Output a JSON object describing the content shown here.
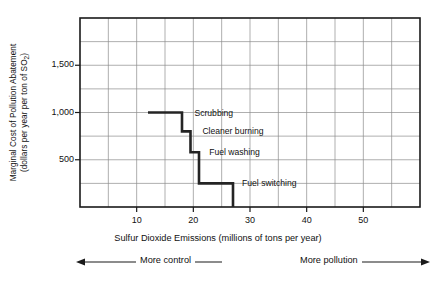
{
  "chart_data": {
    "type": "line",
    "title": "",
    "subtitle": "",
    "xlabel": "Sulfur Dioxide Emissions (millions of tons per year)",
    "ylabel_line1": "Marginal Cost of Pollution Abatement",
    "ylabel_line2_pre": "(dollars per year per ton of SO",
    "ylabel_line2_sub": "2",
    "ylabel_line2_post": ")",
    "xlim": [
      0,
      60
    ],
    "ylim": [
      0,
      2000
    ],
    "xticks": [
      10,
      20,
      30,
      40,
      50
    ],
    "xtick_labels": [
      "10",
      "20",
      "30",
      "40",
      "50"
    ],
    "yticks": [
      500,
      1000,
      1500
    ],
    "ytick_labels": [
      "500",
      "1,000",
      "1,500"
    ],
    "x_gridlines": [
      5,
      10,
      15,
      20,
      25,
      30,
      35,
      40,
      45,
      50,
      55
    ],
    "y_gridlines": [
      250,
      500,
      750,
      1000,
      1250,
      1500,
      1750
    ],
    "grid": true,
    "legend": "none",
    "series": [
      {
        "name": "Marginal abatement cost step function",
        "type": "step",
        "points": [
          {
            "x": 12,
            "y": 1000
          },
          {
            "x": 18,
            "y": 1000
          },
          {
            "x": 18,
            "y": 800
          },
          {
            "x": 19.5,
            "y": 800
          },
          {
            "x": 19.5,
            "y": 580
          },
          {
            "x": 21,
            "y": 580
          },
          {
            "x": 21,
            "y": 250
          },
          {
            "x": 27,
            "y": 250
          },
          {
            "x": 27,
            "y": 0
          }
        ]
      }
    ],
    "annotations": [
      {
        "label": "Scrubbing",
        "x": 20.2,
        "y": 1000,
        "step_value": 1000
      },
      {
        "label": "Cleaner burning",
        "x": 21.6,
        "y": 800,
        "step_value": 800
      },
      {
        "label": "Fuel washing",
        "x": 22.8,
        "y": 580,
        "step_value": 580
      },
      {
        "label": "Fuel switching",
        "x": 28.6,
        "y": 250,
        "step_value": 250
      }
    ],
    "direction_notes": [
      {
        "label": "More control",
        "arrow": "left",
        "arrow_glyph": "←"
      },
      {
        "label": "More pollution",
        "arrow": "right",
        "arrow_glyph": "→"
      }
    ],
    "colors": {
      "background": "#ffffff",
      "axis": "#1a1a1a",
      "grid": "#8c8c8c",
      "curve": "#242424",
      "text": "#111111"
    }
  }
}
